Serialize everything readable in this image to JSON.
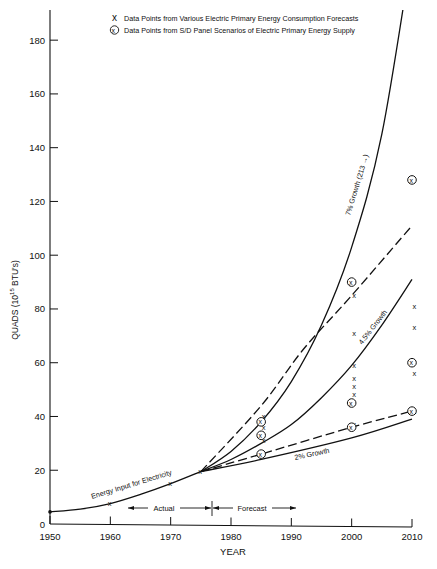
{
  "chart_data": {
    "type": "line",
    "title": "",
    "xlabel": "YEAR",
    "ylabel": "QUADS (10^15 BTU's)",
    "ylabel_parts": {
      "main": "QUADS (10",
      "sup": "15",
      "tail": " BTU's)"
    },
    "xlim": [
      1950,
      2010
    ],
    "ylim": [
      0,
      190
    ],
    "grid": false,
    "x_ticks": [
      1950,
      1960,
      1970,
      1980,
      1990,
      2000,
      2010
    ],
    "y_ticks": [
      0,
      20,
      40,
      60,
      80,
      100,
      120,
      140,
      160,
      180
    ],
    "legend": {
      "position": "top",
      "entries": [
        {
          "marker": "x",
          "label": "Data Points from Various Electric Primary Energy Consumption Forecasts"
        },
        {
          "marker": "circled-x",
          "label": "Data Points from S/D Panel Scenarios of Electric Primary Energy Supply"
        }
      ]
    },
    "annotations": {
      "actual": "Actual",
      "forecast": "Forecast",
      "actual_range": [
        1962,
        1977
      ],
      "forecast_range": [
        1977,
        1991
      ]
    },
    "series": [
      {
        "name": "Energy Input for Electricity",
        "style": "solid",
        "x": [
          1950,
          1955,
          1960,
          1965,
          1970,
          1975
        ],
        "y": [
          4.5,
          5.5,
          7.6,
          11,
          15,
          19.5
        ]
      },
      {
        "name": "7% Growth (213 →)",
        "style": "solid",
        "x": [
          1975,
          1980,
          1985,
          1990,
          1995,
          2000,
          2005,
          2010
        ],
        "y": [
          19.5,
          27,
          38,
          53,
          74,
          103,
          145,
          213
        ]
      },
      {
        "name": "Upper Dashed Projection",
        "style": "dashed",
        "x": [
          1975,
          1985,
          1992,
          2000,
          2010
        ],
        "y": [
          19.5,
          44,
          65,
          85,
          111
        ]
      },
      {
        "name": "4.5% Growth",
        "style": "solid",
        "x": [
          1975,
          1980,
          1985,
          1990,
          1995,
          2000,
          2005,
          2010
        ],
        "y": [
          19.5,
          24,
          30,
          37,
          47,
          59,
          74,
          91
        ]
      },
      {
        "name": "Lower Dashed Projection",
        "style": "dashed",
        "x": [
          1975,
          1985,
          2000,
          2010
        ],
        "y": [
          19.5,
          26,
          36,
          42
        ]
      },
      {
        "name": "2% Growth",
        "style": "solid",
        "x": [
          1975,
          1985,
          2000,
          2010
        ],
        "y": [
          19.5,
          24,
          32,
          39
        ]
      }
    ],
    "scatter": {
      "forecast_points_x": [
        {
          "x": 1960,
          "y": 7.6
        },
        {
          "x": 1970,
          "y": 15
        },
        {
          "x": 1975,
          "y": 19.5
        },
        {
          "x": 1985,
          "y": 40
        },
        {
          "x": 1985,
          "y": 36
        },
        {
          "x": 1985,
          "y": 31
        },
        {
          "x": 2000,
          "y": 85
        },
        {
          "x": 2000,
          "y": 71
        },
        {
          "x": 2000,
          "y": 59
        },
        {
          "x": 2000,
          "y": 54
        },
        {
          "x": 2000,
          "y": 51
        },
        {
          "x": 2000,
          "y": 48
        },
        {
          "x": 2000,
          "y": 37
        },
        {
          "x": 2010,
          "y": 81
        },
        {
          "x": 2010,
          "y": 73
        },
        {
          "x": 2010,
          "y": 56
        },
        {
          "x": 2010,
          "y": 42
        }
      ],
      "panel_points_circled": [
        {
          "x": 1985,
          "y": 38
        },
        {
          "x": 1985,
          "y": 33
        },
        {
          "x": 1985,
          "y": 26
        },
        {
          "x": 2000,
          "y": 90
        },
        {
          "x": 2000,
          "y": 45
        },
        {
          "x": 2000,
          "y": 36
        },
        {
          "x": 2010,
          "y": 128
        },
        {
          "x": 2010,
          "y": 60
        },
        {
          "x": 2010,
          "y": 42
        }
      ]
    },
    "curve_labels": {
      "energy_input": "Energy Input for Electricity",
      "growth_7": "7% Growth  (213 →)",
      "growth_45": "4.5% Growth",
      "growth_2": "2% Growth"
    }
  }
}
